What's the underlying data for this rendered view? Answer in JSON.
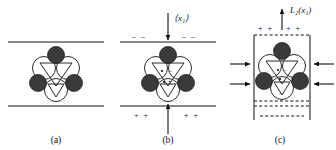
{
  "figure": {
    "type": "scientific-schematic",
    "background_color": "#ffffff",
    "line_color": "#111111",
    "dark_atom_color": "#3a3a3a",
    "light_atom_color": "#ffffff"
  },
  "panels": [
    {
      "id": "a",
      "label": "(a)",
      "caption_x": 50,
      "boundaries": [
        "top-solid-line",
        "bottom-solid-line"
      ],
      "boundary_style": "solid",
      "charges": [],
      "arrows": [],
      "field_label": ""
    },
    {
      "id": "b",
      "label": "(b)",
      "caption_x": 172,
      "boundaries": [
        "top-solid-line",
        "bottom-solid-line"
      ],
      "boundary_style": "solid",
      "field_label": "⟨x₁⟩",
      "charges_top": [
        "– –",
        "– –"
      ],
      "charges_bottom": [
        "+ +",
        "+ +"
      ],
      "internal_dipole": [
        "–",
        "+"
      ],
      "arrows": [
        "down-arrow-top",
        "up-arrow-bottom"
      ]
    },
    {
      "id": "c",
      "label": "(c)",
      "caption_x": 288,
      "boundaries": [
        "top-dashed-line",
        "bottom-dashed-line",
        "extra-dashed-line",
        "left-solid-wall",
        "right-solid-wall"
      ],
      "boundary_style": "dashed",
      "field_label": "L₂(x₁)",
      "charges_top": [
        "+ +",
        "+ +"
      ],
      "internal_signs": [
        "–",
        "–"
      ],
      "arrows": [
        "up-arrow-top",
        "left-inward-arrow-upper",
        "left-inward-arrow-lower",
        "right-inward-arrow-upper",
        "right-inward-arrow-lower"
      ]
    }
  ],
  "cluster": {
    "name": "tetrahedral-cluster",
    "dark_atoms": 3,
    "light_atoms": 4,
    "triangles": 2,
    "dark_atom_radius": 8.5,
    "light_atom_radius": 11
  }
}
